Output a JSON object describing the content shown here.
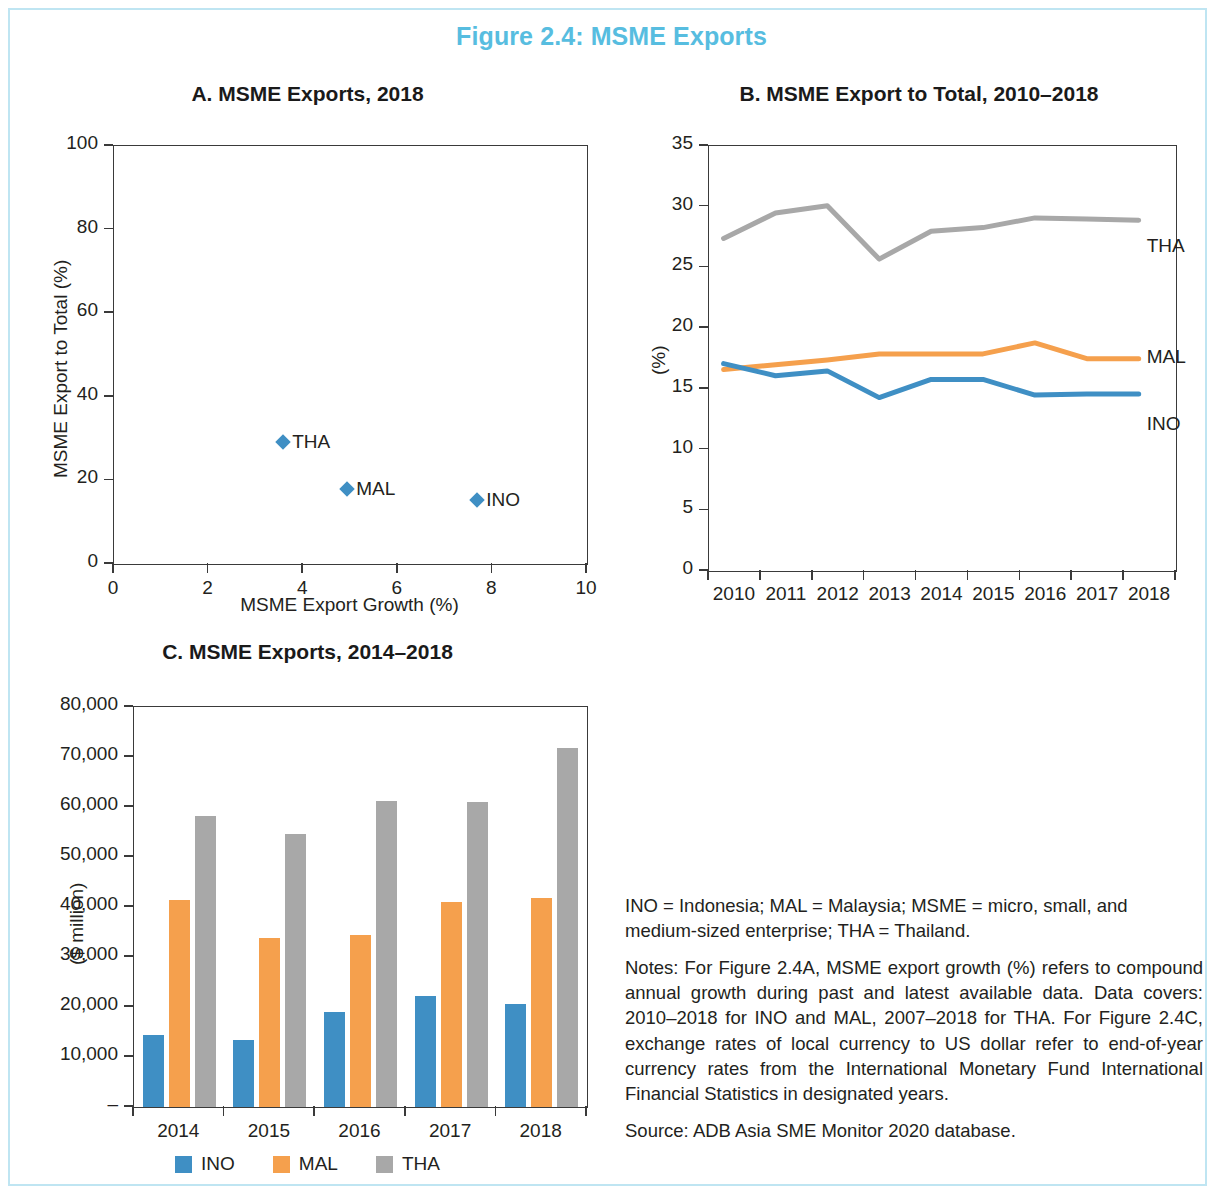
{
  "figure": {
    "title": "Figure 2.4: MSME Exports",
    "title_color": "#57bde0",
    "frame_color": "#bfe5f2"
  },
  "colors": {
    "ino": "#3f8fc4",
    "mal": "#f5a04d",
    "tha": "#a8a8a8",
    "axis": "#3a3a3a"
  },
  "notes": {
    "abbreviations": "INO = Indonesia; MAL = Malaysia; MSME = micro, small, and medium-sized enterprise; THA = Thailand.",
    "note": "Notes: For Figure 2.4A, MSME export growth (%) refers to compound annual growth during past and latest available data. Data covers: 2010–2018 for INO and MAL, 2007–2018 for THA. For Figure 2.4C, exchange rates of local currency to US dollar refer to end-of-year currency rates from the International Monetary Fund International Financial Statistics in designated years.",
    "source": "Source: ADB Asia SME Monitor 2020 database."
  },
  "chart_data": [
    {
      "id": "A",
      "type": "scatter",
      "title": "A. MSME Exports, 2018",
      "xlabel": "MSME Export Growth (%)",
      "ylabel": "MSME Export to Total (%)",
      "xlim": [
        0,
        10
      ],
      "ylim": [
        0,
        100
      ],
      "xticks": [
        0,
        2,
        4,
        6,
        8,
        10
      ],
      "yticks": [
        0,
        20,
        40,
        60,
        80,
        100
      ],
      "xtick_labels": [
        "0",
        "2",
        "4",
        "6",
        "8",
        "10"
      ],
      "ytick_labels": [
        "0",
        "20",
        "40",
        "60",
        "80",
        "100"
      ],
      "grid": false,
      "marker": "diamond",
      "marker_color": "#3f8fc4",
      "points": [
        {
          "label": "THA",
          "x": 3.6,
          "y": 28.9
        },
        {
          "label": "MAL",
          "x": 4.95,
          "y": 17.6
        },
        {
          "label": "INO",
          "x": 7.7,
          "y": 15.0
        }
      ]
    },
    {
      "id": "B",
      "type": "line",
      "title": "B. MSME Export to Total, 2010–2018",
      "xlabel": "",
      "ylabel": "(%)",
      "ylim": [
        0,
        35
      ],
      "yticks": [
        0,
        5,
        10,
        15,
        20,
        25,
        30,
        35
      ],
      "ytick_labels": [
        "0",
        "5",
        "10",
        "15",
        "20",
        "25",
        "30",
        "35"
      ],
      "categories": [
        "2010",
        "2011",
        "2012",
        "2013",
        "2014",
        "2015",
        "2016",
        "2017",
        "2018"
      ],
      "grid": false,
      "legend_position": "inline-right",
      "series": [
        {
          "name": "THA",
          "color": "#a8a8a8",
          "values": [
            27.3,
            29.4,
            30.0,
            25.6,
            27.9,
            28.2,
            29.0,
            28.9,
            28.8
          ]
        },
        {
          "name": "MAL",
          "color": "#f5a04d",
          "values": [
            16.5,
            16.9,
            17.3,
            17.8,
            17.8,
            17.8,
            18.7,
            17.4,
            17.4
          ]
        },
        {
          "name": "INO",
          "color": "#3f8fc4",
          "values": [
            17.0,
            16.0,
            16.4,
            14.2,
            15.7,
            15.7,
            14.4,
            14.5,
            14.5
          ]
        }
      ]
    },
    {
      "id": "C",
      "type": "bar",
      "title": "C. MSME Exports, 2014–2018",
      "xlabel": "",
      "ylabel": "($ million)",
      "ylim": [
        0,
        80000
      ],
      "yticks": [
        0,
        10000,
        20000,
        30000,
        40000,
        50000,
        60000,
        70000,
        80000
      ],
      "ytick_labels": [
        "–",
        "10,000",
        "20,000",
        "30,000",
        "40,000",
        "50,000",
        "60,000",
        "70,000",
        "80,000"
      ],
      "categories": [
        "2014",
        "2015",
        "2016",
        "2017",
        "2018"
      ],
      "grid": false,
      "legend_position": "bottom",
      "series": [
        {
          "name": "INO",
          "color": "#3f8fc4",
          "values": [
            14500,
            13500,
            19000,
            22300,
            20600
          ]
        },
        {
          "name": "MAL",
          "color": "#f5a04d",
          "values": [
            41500,
            33800,
            34500,
            41000,
            41800
          ]
        },
        {
          "name": "THA",
          "color": "#a8a8a8",
          "values": [
            58200,
            54700,
            61200,
            61000,
            71800
          ]
        }
      ]
    }
  ]
}
